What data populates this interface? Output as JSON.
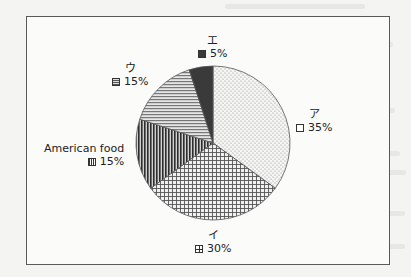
{
  "chart_data": {
    "type": "pie",
    "title": "",
    "start_angle": "12 o'clock",
    "direction": "clockwise",
    "legend": "none (data labels next to slices)",
    "slices": [
      {
        "label": "ア",
        "value": 35,
        "value_label": "35%",
        "pattern": "dots",
        "color": "#f2f2f2"
      },
      {
        "label": "イ",
        "value": 30,
        "value_label": "30%",
        "pattern": "grid",
        "color": "#d8d8d8"
      },
      {
        "label": "American food",
        "value": 15,
        "value_label": "15%",
        "pattern": "vertical-lines",
        "color": "#555555"
      },
      {
        "label": "ウ",
        "value": 15,
        "value_label": "15%",
        "pattern": "horizontal-lines",
        "color": "#bdbdbd"
      },
      {
        "label": "エ",
        "value": 5,
        "value_label": "5%",
        "pattern": "solid",
        "color": "#3a3a3a"
      }
    ]
  }
}
